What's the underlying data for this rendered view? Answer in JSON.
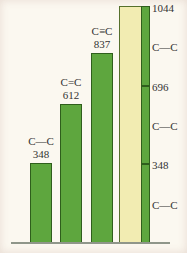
{
  "colors": {
    "background": "#fbf8f0",
    "bar_green": "#5ea63e",
    "bar_green_border": "#2f5e1c",
    "bar_yellow": "#f2ecb2",
    "bar_yellow_border": "#56702c",
    "baseline": "#8f968a",
    "text": "#333333"
  },
  "chart_data": {
    "type": "bar",
    "title": "",
    "xlabel": "",
    "ylabel": "",
    "ylim": [
      0,
      1044
    ],
    "grid": false,
    "legend": false,
    "bars": [
      {
        "bond_label": "C—C",
        "value": 348,
        "value_label": "348",
        "color": "green"
      },
      {
        "bond_label": "C=C",
        "value": 612,
        "value_label": "612",
        "color": "green"
      },
      {
        "bond_label": "C≡C",
        "value": 837,
        "value_label": "837",
        "color": "green"
      },
      {
        "bond_label": "",
        "value": 1044,
        "value_label": "",
        "color": "yellow"
      }
    ],
    "stacked_scale_column": {
      "total": 1044,
      "segments": [
        {
          "bond_label": "C—C",
          "value": 348
        },
        {
          "bond_label": "C—C",
          "value": 348
        },
        {
          "bond_label": "C—C",
          "value": 348
        }
      ],
      "tick_labels": [
        "1044",
        "696",
        "348"
      ]
    },
    "right_rail": [
      {
        "text": "1044",
        "y": 1044
      },
      {
        "text": "C—C",
        "y": 872
      },
      {
        "text": "696",
        "y": 696
      },
      {
        "text": "C—C",
        "y": 522
      },
      {
        "text": "348",
        "y": 348
      },
      {
        "text": "C—C",
        "y": 174
      }
    ]
  }
}
